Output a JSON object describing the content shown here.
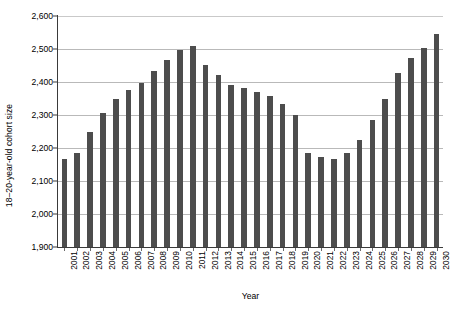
{
  "chart_data": {
    "type": "bar",
    "title": "",
    "xlabel": "Year",
    "ylabel": "18–20-year-old cohort size",
    "ylim": [
      1900,
      2600
    ],
    "ytick_step": 100,
    "ytick_labels": [
      "2,600",
      "2,500",
      "2,400",
      "2,300",
      "2,200",
      "2,100",
      "2,000",
      "1,900"
    ],
    "ytick_values": [
      2600,
      2500,
      2400,
      2300,
      2200,
      2100,
      2000,
      1900
    ],
    "grid": true,
    "grid_axis": "y",
    "legend": false,
    "bar_color": "#4d4d4d",
    "categories": [
      "2001",
      "2002",
      "2003",
      "2004",
      "2005",
      "2006",
      "2007",
      "2008",
      "2009",
      "2010",
      "2011",
      "2012",
      "2013",
      "2014",
      "2015",
      "2016",
      "2017",
      "2018",
      "2019",
      "2020",
      "2021",
      "2022",
      "2023",
      "2024",
      "2025",
      "2026",
      "2027",
      "2028",
      "2029",
      "2030"
    ],
    "values": [
      2168,
      2184,
      2250,
      2307,
      2348,
      2375,
      2397,
      2432,
      2468,
      2497,
      2508,
      2452,
      2420,
      2390,
      2382,
      2370,
      2357,
      2332,
      2301,
      2184,
      2172,
      2166,
      2184,
      2224,
      2284,
      2350,
      2428,
      2473,
      2503,
      2547
    ]
  }
}
